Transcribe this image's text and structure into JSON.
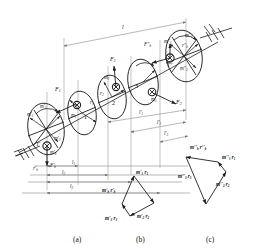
{
  "figure": {
    "type": "engineering-line-diagram",
    "stroke_color": "#1f1f1f",
    "background": "#ffffff"
  },
  "panels": [
    {
      "id": "a",
      "caption": "(a)",
      "description": "shaft with three unbalance planes and two correction planes"
    },
    {
      "id": "b",
      "caption": "(b)",
      "description": "vector polygon for left correction plane T'"
    },
    {
      "id": "c",
      "caption": "(c)",
      "description": "vector polygon for right correction plane T''"
    }
  ],
  "panel_a": {
    "disks": [
      {
        "name": "left-correction-plane",
        "number": "",
        "plane_label": "T'",
        "mass_labels": [
          "m'1",
          "m'2",
          "m'3",
          "m'b"
        ],
        "radius_label": "r'b",
        "force_label": "F'b"
      },
      {
        "name": "disk-1",
        "number": "1",
        "mass_label": "m1",
        "radius_label": "r1",
        "force_label": "F1"
      },
      {
        "name": "disk-2",
        "number": "2",
        "mass_label": "m2",
        "radius_label": "r2",
        "force_label": "F2"
      },
      {
        "name": "disk-3",
        "number": "3",
        "mass_label": "m3",
        "radius_label": "r3",
        "force_label": "F3"
      },
      {
        "name": "right-correction-plane",
        "number": "",
        "plane_label": "T''",
        "mass_labels": [
          "m''1",
          "m''2",
          "m''3",
          "m''b"
        ],
        "radius_label": "r''b",
        "force_label": "F''b"
      }
    ],
    "forces": {
      "f1": "F1",
      "f2": "F2",
      "f3": "F3",
      "fb_left": "F'b",
      "fb_right": "F''b"
    },
    "masses": {
      "m1": "m1",
      "m2": "m2",
      "m3": "m3",
      "m1p": "m'1",
      "m2p": "m'2",
      "m3p": "m'3",
      "mbp": "m'b",
      "m1pp": "m''1",
      "m2pp": "m''2",
      "m3pp": "m''3",
      "mbpp": "m''b"
    },
    "radii": {
      "r1": "r1",
      "r2": "r2",
      "r3": "r3",
      "rbp": "r'b",
      "rbpp": "r''b"
    },
    "planes": {
      "left": "T'",
      "right": "T''"
    },
    "dimensions": {
      "total": "l",
      "left_set": [
        "l1",
        "l2",
        "l3"
      ],
      "right_set": [
        "l'1",
        "l'2",
        "l'3"
      ]
    },
    "disk_numbers": [
      "1",
      "2",
      "3"
    ],
    "supports": [
      "left-bearing-hatch",
      "right-bearing-hatch"
    ]
  },
  "panel_b": {
    "caption": "(b)",
    "closing_vector": "m'b r'b",
    "vectors": [
      {
        "id": "b1",
        "label": "m'1 r1"
      },
      {
        "id": "b2",
        "label": "m'2 r2"
      },
      {
        "id": "b3",
        "label": "m'3 r3"
      },
      {
        "id": "bb",
        "label": "m'b r'b"
      }
    ]
  },
  "panel_c": {
    "caption": "(c)",
    "closing_vector": "m''b r''b",
    "vectors": [
      {
        "id": "c1",
        "label": "m''1 r1"
      },
      {
        "id": "c2",
        "label": "m''2 r2"
      },
      {
        "id": "c3",
        "label": "m''3 r3"
      },
      {
        "id": "cb",
        "label": "m''b r''b"
      }
    ]
  }
}
